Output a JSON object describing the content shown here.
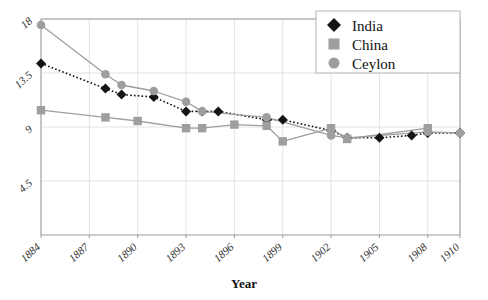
{
  "chart_data": {
    "type": "line",
    "title": "",
    "xlabel": "Year",
    "ylabel": "",
    "x": [
      1884,
      1885,
      1886,
      1887,
      1888,
      1889,
      1890,
      1891,
      1892,
      1893,
      1894,
      1895,
      1896,
      1897,
      1898,
      1899,
      1900,
      1901,
      1902,
      1903,
      1904,
      1905,
      1906,
      1907,
      1908,
      1909,
      1910
    ],
    "xticks": [
      "1884",
      "1887",
      "1890",
      "1893",
      "1896",
      "1899",
      "1902",
      "1905",
      "1908",
      "1910"
    ],
    "xtick_values": [
      1884,
      1887,
      1890,
      1893,
      1896,
      1899,
      1902,
      1905,
      1908,
      1910
    ],
    "yticks": [
      "18",
      "13.5",
      "9",
      "4.5"
    ],
    "ytick_values": [
      18,
      13.5,
      9,
      4.5
    ],
    "ylim": [
      0,
      18
    ],
    "xlim": [
      1884,
      1910
    ],
    "grid": true,
    "legend_position": "top-right",
    "series": [
      {
        "name": "India",
        "marker": "diamond",
        "color": "#141414",
        "line_style": "dotted",
        "points": [
          {
            "x": 1884,
            "y": 14.3
          },
          {
            "x": 1888,
            "y": 12.2
          },
          {
            "x": 1889,
            "y": 11.7
          },
          {
            "x": 1891,
            "y": 11.5
          },
          {
            "x": 1893,
            "y": 10.3
          },
          {
            "x": 1894,
            "y": 10.3
          },
          {
            "x": 1895,
            "y": 10.3
          },
          {
            "x": 1898,
            "y": 9.6
          },
          {
            "x": 1899,
            "y": 9.6
          },
          {
            "x": 1902,
            "y": 8.7
          },
          {
            "x": 1903,
            "y": 8.1
          },
          {
            "x": 1905,
            "y": 8.1
          },
          {
            "x": 1907,
            "y": 8.3
          },
          {
            "x": 1908,
            "y": 8.5
          },
          {
            "x": 1910,
            "y": 8.5
          }
        ]
      },
      {
        "name": "China",
        "marker": "square",
        "color": "#9e9e9e",
        "line_style": "solid",
        "points": [
          {
            "x": 1884,
            "y": 10.4
          },
          {
            "x": 1888,
            "y": 9.8
          },
          {
            "x": 1890,
            "y": 9.5
          },
          {
            "x": 1893,
            "y": 8.9
          },
          {
            "x": 1894,
            "y": 8.9
          },
          {
            "x": 1896,
            "y": 9.2
          },
          {
            "x": 1898,
            "y": 9.1
          },
          {
            "x": 1899,
            "y": 7.8
          },
          {
            "x": 1902,
            "y": 8.9
          },
          {
            "x": 1903,
            "y": 8.0
          },
          {
            "x": 1908,
            "y": 8.9
          }
        ]
      },
      {
        "name": "Ceylon",
        "marker": "circle",
        "color": "#9e9e9e",
        "line_style": "solid",
        "points": [
          {
            "x": 1884,
            "y": 17.5
          },
          {
            "x": 1888,
            "y": 13.4
          },
          {
            "x": 1889,
            "y": 12.5
          },
          {
            "x": 1891,
            "y": 12.0
          },
          {
            "x": 1893,
            "y": 11.1
          },
          {
            "x": 1894,
            "y": 10.3
          },
          {
            "x": 1898,
            "y": 9.8
          },
          {
            "x": 1902,
            "y": 8.3
          },
          {
            "x": 1903,
            "y": 8.1
          },
          {
            "x": 1908,
            "y": 8.6
          },
          {
            "x": 1910,
            "y": 8.5
          }
        ]
      }
    ]
  },
  "legend": {
    "items": [
      {
        "label": "India",
        "marker": "diamond",
        "color": "#141414"
      },
      {
        "label": "China",
        "marker": "square",
        "color": "#9e9e9e"
      },
      {
        "label": "Ceylon",
        "marker": "circle",
        "color": "#9e9e9e"
      }
    ]
  },
  "axes": {
    "x_title": "Year",
    "y_title": ""
  },
  "colors": {
    "india": "#141414",
    "china": "#9e9e9e",
    "ceylon": "#9e9e9e",
    "frame": "#9a9a9a",
    "grid": "#e3e3e3",
    "background": "#ffffff"
  }
}
